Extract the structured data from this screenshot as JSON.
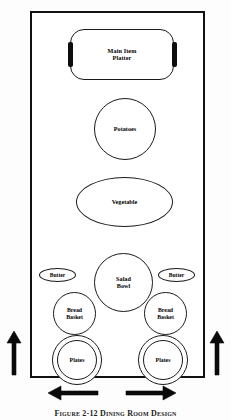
{
  "diagram": {
    "type": "buffet-table-layout",
    "caption": "Figure 2-12  Dining Room Design",
    "frame": {
      "name": "buffet-table",
      "border_color": "#111111",
      "fill_color": "#ffffff"
    },
    "items": [
      {
        "id": "main-item-platter",
        "label": "Main Item\nPlatter",
        "shape": "rounded-rectangle",
        "has_handles": true
      },
      {
        "id": "potatoes",
        "label": "Potatoes",
        "shape": "circle",
        "has_handles": false
      },
      {
        "id": "vegetable",
        "label": "Vegetable",
        "shape": "ellipse",
        "has_handles": false
      },
      {
        "id": "salad-bowl",
        "label": "Salad\nBowl",
        "shape": "circle",
        "has_handles": false
      },
      {
        "id": "butter-left",
        "label": "Butter",
        "shape": "pill",
        "has_handles": false
      },
      {
        "id": "butter-right",
        "label": "Butter",
        "shape": "pill",
        "has_handles": false
      },
      {
        "id": "bread-basket-left",
        "label": "Bread\nBasket",
        "shape": "circle",
        "has_handles": false
      },
      {
        "id": "bread-basket-right",
        "label": "Bread\nBasket",
        "shape": "circle",
        "has_handles": false
      },
      {
        "id": "plates-left",
        "label": "Plates",
        "shape": "double-circle",
        "has_handles": false
      },
      {
        "id": "plates-right",
        "label": "Plates",
        "shape": "double-circle",
        "has_handles": false
      }
    ],
    "arrows": [
      {
        "id": "arrow-up-left",
        "direction": "up",
        "position": "outside-left"
      },
      {
        "id": "arrow-up-right",
        "direction": "up",
        "position": "outside-right"
      },
      {
        "id": "arrow-left",
        "direction": "left",
        "position": "below-bottom"
      },
      {
        "id": "arrow-right",
        "direction": "right",
        "position": "below-bottom"
      }
    ],
    "colors": {
      "line": "#1a1a1a",
      "fill": "#ffffff",
      "accent": "#0d0d0d",
      "background": "#fdfdfd"
    }
  }
}
